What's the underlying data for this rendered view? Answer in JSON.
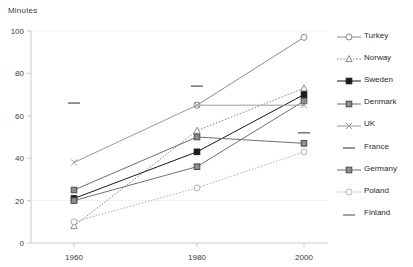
{
  "axis_title": "Minutes",
  "legend": {
    "position": "right",
    "items": [
      {
        "label": "Turkey",
        "marker": "open-circle",
        "dash": "solid",
        "color": "#8a8a8a"
      },
      {
        "label": "Norway",
        "marker": "open-triangle",
        "dash": "dotted",
        "color": "#8a8a8a"
      },
      {
        "label": "Sweden",
        "marker": "filled-square",
        "dash": "solid",
        "color": "#1a1a1a"
      },
      {
        "label": "Denmark",
        "marker": "gray-square",
        "dash": "solid",
        "color": "#707070"
      },
      {
        "label": "UK",
        "marker": "cross",
        "dash": "solid",
        "color": "#9a9a9a"
      },
      {
        "label": "France",
        "marker": "dash",
        "dash": "none",
        "color": "#7a7a7a"
      },
      {
        "label": "Germany",
        "marker": "gray-square",
        "dash": "solid",
        "color": "#6e6e6e"
      },
      {
        "label": "Poland",
        "marker": "open-circle",
        "dash": "dotted",
        "color": "#b0b0b0"
      },
      {
        "label": "Finland",
        "marker": "dash",
        "dash": "none",
        "color": "#8a8a8a"
      }
    ]
  },
  "chart_data": {
    "type": "line",
    "title": "",
    "xlabel": "",
    "ylabel": "Minutes",
    "x": [
      1960,
      1980,
      2000
    ],
    "xticklabels": [
      "1960",
      "1980",
      "2000"
    ],
    "yticks": [
      0,
      20,
      40,
      60,
      80,
      100
    ],
    "yticklabels": [
      "0",
      "20",
      "40",
      "60",
      "80",
      "100"
    ],
    "ylim": [
      0,
      100
    ],
    "grid": false,
    "series": [
      {
        "name": "Turkey",
        "values": [
          null,
          65,
          97
        ]
      },
      {
        "name": "Norway",
        "values": [
          8,
          53,
          73
        ]
      },
      {
        "name": "Sweden",
        "values": [
          21,
          43,
          70
        ]
      },
      {
        "name": "Denmark",
        "values": [
          20,
          36,
          67
        ]
      },
      {
        "name": "UK",
        "values": [
          38,
          65,
          65
        ]
      },
      {
        "name": "France",
        "values": [
          66,
          74,
          52
        ]
      },
      {
        "name": "Germany",
        "values": [
          25,
          50,
          47
        ]
      },
      {
        "name": "Poland",
        "values": [
          10,
          26,
          43
        ]
      },
      {
        "name": "Finland",
        "values": [
          null,
          null,
          null
        ]
      }
    ]
  }
}
